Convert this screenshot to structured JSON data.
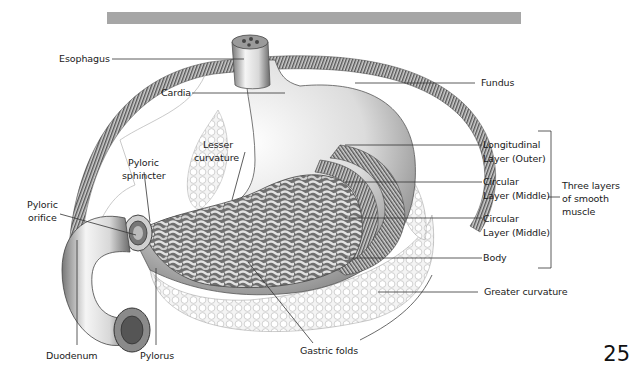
{
  "diagram": {
    "title_bar_color": "#a6a6a6",
    "page_number": "25",
    "labels": {
      "esophagus": "Esophagus",
      "cardia": "Cardia",
      "fundus": "Fundus",
      "lesser_curvature_1": "Lesser",
      "lesser_curvature_2": "curvature",
      "pyloric_sphincter_1": "Pyloric",
      "pyloric_sphincter_2": "sphincter",
      "pyloric_orifice_1": "Pyloric",
      "pyloric_orifice_2": "orifice",
      "longitudinal_1": "Longitudinal",
      "longitudinal_2": "Layer (Outer)",
      "circular_a_1": "Circular",
      "circular_a_2": "Layer (Middle)",
      "circular_b_1": "Circular",
      "circular_b_2": "Layer (Middle)",
      "body": "Body",
      "three_layers_1": "Three layers",
      "three_layers_2": "of smooth",
      "three_layers_3": "muscle",
      "greater_curvature": "Greater curvature",
      "duodenum": "Duodenum",
      "pylorus": "Pylorus",
      "gastric_folds": "Gastric folds"
    },
    "colors": {
      "muscle_band": "#6e6e6e",
      "stomach_light": "#f2f2f2",
      "stomach_mid": "#bdbdbd",
      "stomach_dark": "#7a7a7a",
      "fat": "#e6e6e6",
      "leader_line": "#333333"
    }
  }
}
